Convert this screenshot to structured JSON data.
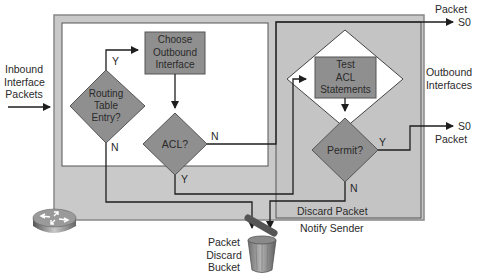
{
  "diagram": {
    "type": "flowchart",
    "inbound_label": [
      "Inbound",
      "Interface",
      "Packets"
    ],
    "outbound_label": [
      "Outbound",
      "Interfaces"
    ],
    "nodes": {
      "routing_table_entry": [
        "Routing",
        "Table",
        "Entry?"
      ],
      "choose_outbound": [
        "Choose",
        "Outbound",
        "Interface"
      ],
      "acl_check": "ACL?",
      "test_acl": [
        "Test",
        "ACL",
        "Statements"
      ],
      "permit": "Permit?"
    },
    "edge_labels": {
      "routing_yes": "Y",
      "routing_no": "N",
      "acl_no": "N",
      "acl_yes": "Y",
      "permit_yes": "Y",
      "permit_no": "N"
    },
    "outputs": {
      "top_packet": "Packet",
      "top_s0": "S0",
      "right_s0": "S0",
      "right_packet": "Packet"
    },
    "discard": {
      "discard_packet": "Discard Packet",
      "notify_sender": "Notify Sender",
      "bucket_label": [
        "Packet",
        "Discard",
        "Bucket"
      ]
    },
    "colors": {
      "outer_panel": "#c8c8c8",
      "inner_panel": "#ffffff",
      "node_fill": "#8f8f8f",
      "line": "#2b2b2b"
    }
  }
}
